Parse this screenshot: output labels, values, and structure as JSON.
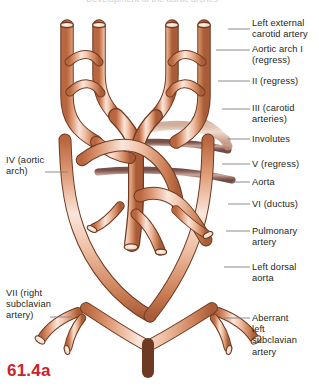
{
  "figure": {
    "caption": "61.4a",
    "caption_color": "#cf2027",
    "top_cut_text": "Development of the aortic arches",
    "background": "#ffffff"
  },
  "palette": {
    "vessel_light": "#f3cdb8",
    "vessel_mid": "#e09a77",
    "vessel_dark": "#c2714c",
    "vessel_outline": "#6e3a22",
    "regress_light": "#c9a69b",
    "regress_mid": "#9a6b63",
    "regress_dark": "#7a4f49",
    "lumen": "#fbeee6",
    "leader_line": "#808084",
    "text": "#231f20"
  },
  "labels_right": [
    {
      "id": "left-external-carotid-artery",
      "text": "Left external\ncarotid artery",
      "text_x": 252,
      "text_y": 18,
      "leader_y": 29,
      "leader_x1": 228,
      "leader_x2": 250
    },
    {
      "id": "aortic-arch-i-regress",
      "text": "Aortic arch I\n(regress)",
      "text_x": 252,
      "text_y": 44,
      "leader_y": 50,
      "leader_x1": 216,
      "leader_x2": 250
    },
    {
      "id": "ii-regress",
      "text": "II (regress)",
      "text_x": 252,
      "text_y": 76,
      "leader_y": 81,
      "leader_x1": 218,
      "leader_x2": 250
    },
    {
      "id": "iii-carotid-arteries",
      "text": "III (carotid\narteries)",
      "text_x": 252,
      "text_y": 103,
      "leader_y": 109,
      "leader_x1": 222,
      "leader_x2": 250
    },
    {
      "id": "involutes",
      "text": "Involutes",
      "text_x": 252,
      "text_y": 134,
      "leader_y": 139,
      "leader_x1": 228,
      "leader_x2": 250
    },
    {
      "id": "v-regress",
      "text": "V (regress)",
      "text_x": 252,
      "text_y": 159,
      "leader_y": 164,
      "leader_x1": 222,
      "leader_x2": 250
    },
    {
      "id": "aorta",
      "text": "Aorta",
      "text_x": 252,
      "text_y": 177,
      "leader_y": 182,
      "leader_x1": 232,
      "leader_x2": 250
    },
    {
      "id": "vi-ductus",
      "text": "VI (ductus)",
      "text_x": 252,
      "text_y": 199,
      "leader_y": 204,
      "leader_x1": 228,
      "leader_x2": 250
    },
    {
      "id": "pulmonary-artery",
      "text": "Pulmonary\nartery",
      "text_x": 252,
      "text_y": 226,
      "leader_y": 231,
      "leader_x1": 226,
      "leader_x2": 250
    },
    {
      "id": "left-dorsal-aorta",
      "text": "Left dorsal\naorta",
      "text_x": 252,
      "text_y": 262,
      "leader_y": 267,
      "leader_x1": 224,
      "leader_x2": 250
    },
    {
      "id": "aberrant-left-subclavian-artery",
      "text": "Aberrant\nleft\nsubclavian\nartery",
      "text_x": 252,
      "text_y": 313,
      "leader_y": 318,
      "leader_x1": 224,
      "leader_x2": 250
    }
  ],
  "labels_left": [
    {
      "id": "iv-aortic-arch",
      "line1": "IV (aortic",
      "line2": "arch)",
      "text_x": 6,
      "text_y": 155,
      "leader_y": 172,
      "leader_x1": 45,
      "leader_x2": 68
    },
    {
      "id": "vii-right-subclavian-artery",
      "line1": "VII (right",
      "line2": "subclavian",
      "line3": "artery)",
      "text_x": 6,
      "text_y": 288,
      "leader_y": 317,
      "leader_x1": 50,
      "leader_x2": 72
    }
  ],
  "anatomy_notes": {
    "view": "ventral view of embryonic aortic arch system",
    "arch_numbers": [
      "I",
      "II",
      "III",
      "IV",
      "V",
      "VI",
      "VII"
    ],
    "regressing_vessels": [
      "Aortic arch I",
      "II",
      "V"
    ],
    "persisting_vessels": [
      "III (carotid arteries)",
      "IV (aortic arch)",
      "VI (ductus)",
      "VII (right subclavian artery)"
    ]
  }
}
